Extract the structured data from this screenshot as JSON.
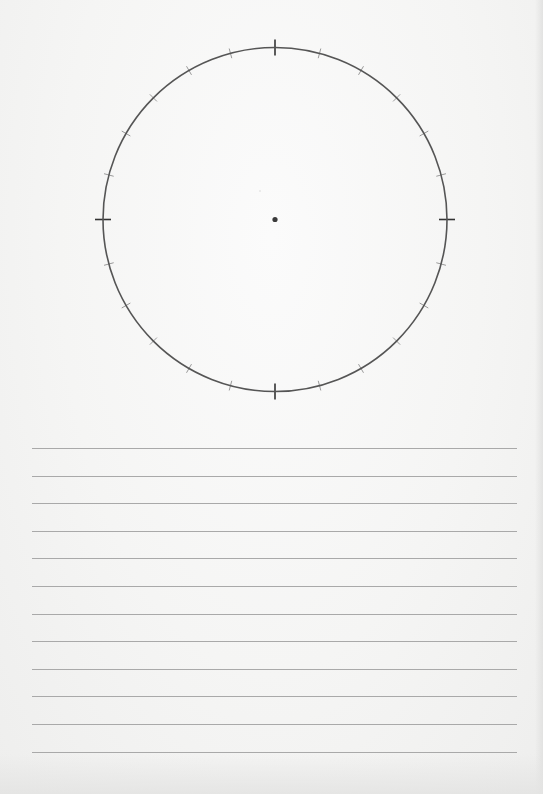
{
  "worksheet": {
    "title": "",
    "circle": {
      "tick_count": 24,
      "tick_interval_degrees": 15,
      "major_tick_angles_degrees": [
        0,
        90,
        180,
        270
      ],
      "has_center_dot": true
    },
    "writing_lines": {
      "count": 12,
      "content": [
        "",
        "",
        "",
        "",
        "",
        "",
        "",
        "",
        "",
        "",
        "",
        ""
      ]
    }
  },
  "colors": {
    "paper": "#f4f4f3",
    "circle_stroke": "#555555",
    "major_tick": "#333333",
    "minor_tick": "#9a9a9a",
    "center_dot": "#3a3a3a",
    "ruled_line": "#a9a9a9"
  }
}
